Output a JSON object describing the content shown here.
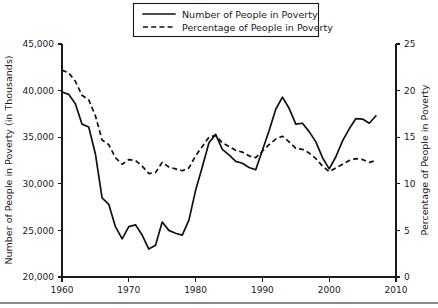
{
  "legend": {
    "position": "top-center",
    "entries": [
      {
        "label": "Number of People in Poverty",
        "style": "solid",
        "axis": "left"
      },
      {
        "label": "Percentage of People in Poverty",
        "style": "dashed",
        "axis": "right"
      }
    ]
  },
  "axes": {
    "left_title": "Number of People in Poverty (in Thousands)",
    "right_title": "Percentage of People in Poverty",
    "x_title": "",
    "left_ticks": [
      "20,000",
      "25,000",
      "30,000",
      "35,000",
      "40,000",
      "45,000"
    ],
    "right_ticks": [
      "0",
      "5",
      "10",
      "15",
      "20",
      "25"
    ],
    "x_ticks": [
      "1960",
      "1970",
      "1980",
      "1990",
      "2000",
      "2010"
    ]
  },
  "chart_data": {
    "type": "line",
    "title": "",
    "subtitle": "",
    "xlabel": "",
    "ylabel": "Number of People in Poverty (in Thousands)",
    "y2label": "Percentage of People in Poverty",
    "xlim": [
      1960,
      2010
    ],
    "ylim": [
      20000,
      45000
    ],
    "y2lim": [
      0,
      25
    ],
    "grid": false,
    "legend_position": "top-center",
    "x": [
      1960,
      1961,
      1962,
      1963,
      1964,
      1965,
      1966,
      1967,
      1968,
      1969,
      1970,
      1971,
      1972,
      1973,
      1974,
      1975,
      1976,
      1977,
      1978,
      1979,
      1980,
      1981,
      1982,
      1983,
      1984,
      1985,
      1986,
      1987,
      1988,
      1989,
      1990,
      1991,
      1992,
      1993,
      1994,
      1995,
      1996,
      1997,
      1998,
      1999,
      2000,
      2001,
      2002,
      2003,
      2004,
      2005,
      2006,
      2007
    ],
    "series": [
      {
        "name": "Number of People in Poverty",
        "style": "solid",
        "axis": "left",
        "units": "thousands",
        "values": [
          39850,
          39600,
          38600,
          36400,
          36100,
          33200,
          28500,
          27800,
          25400,
          24100,
          25400,
          25600,
          24500,
          23000,
          23400,
          25900,
          25000,
          24700,
          24500,
          26100,
          29300,
          31800,
          34400,
          35300,
          33700,
          33100,
          32400,
          32200,
          31750,
          31500,
          33600,
          35700,
          38000,
          39300,
          38100,
          36400,
          36500,
          35600,
          34500,
          32800,
          31600,
          32900,
          34600,
          35900,
          37000,
          36950,
          36500,
          37300
        ]
      },
      {
        "name": "Percentage of People in Poverty",
        "style": "dashed",
        "axis": "right",
        "units": "percent",
        "values": [
          22.2,
          21.9,
          21.0,
          19.5,
          19.0,
          17.3,
          14.7,
          14.2,
          12.8,
          12.1,
          12.6,
          12.5,
          11.9,
          11.1,
          11.2,
          12.3,
          11.8,
          11.6,
          11.4,
          11.7,
          13.0,
          14.0,
          15.0,
          15.2,
          14.4,
          14.0,
          13.6,
          13.4,
          13.0,
          12.8,
          13.5,
          14.2,
          14.8,
          15.1,
          14.5,
          13.8,
          13.7,
          13.3,
          12.7,
          11.9,
          11.3,
          11.7,
          12.1,
          12.5,
          12.7,
          12.6,
          12.3,
          12.5
        ]
      }
    ]
  }
}
